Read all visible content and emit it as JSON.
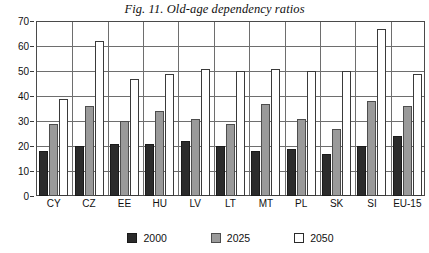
{
  "chart_data": {
    "type": "bar",
    "title": "Fig. 11. Old-age dependency ratios",
    "xlabel": "",
    "ylabel": "",
    "ylim": [
      0,
      70
    ],
    "yticks": [
      0,
      10,
      20,
      30,
      40,
      50,
      60,
      70
    ],
    "grid": true,
    "legend_position": "bottom",
    "categories": [
      "CY",
      "CZ",
      "EE",
      "HU",
      "LV",
      "LT",
      "MT",
      "PL",
      "SK",
      "SI",
      "EU-15"
    ],
    "series": [
      {
        "name": "2000",
        "color": "#2b2b2b",
        "values": [
          18,
          20,
          21,
          21,
          22,
          20,
          18,
          19,
          17,
          20,
          24
        ]
      },
      {
        "name": "2025",
        "color": "#9a9a9a",
        "values": [
          29,
          36,
          30,
          34,
          31,
          29,
          37,
          31,
          27,
          38,
          36
        ]
      },
      {
        "name": "2050",
        "color": "#ffffff",
        "values": [
          39,
          62,
          47,
          49,
          51,
          50,
          51,
          50,
          50,
          67,
          49
        ]
      }
    ]
  },
  "legend": {
    "items": [
      {
        "label": "2000"
      },
      {
        "label": "2025"
      },
      {
        "label": "2050"
      }
    ]
  }
}
